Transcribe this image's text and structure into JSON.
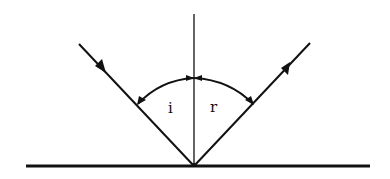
{
  "diagram": {
    "colors": {
      "ink": "#111111",
      "background": "#ffffff"
    },
    "surface": {
      "x1": 26,
      "y1": 166,
      "x2": 370,
      "y2": 166
    },
    "normal": {
      "x1": 194,
      "y1": 14,
      "x2": 194,
      "y2": 166
    },
    "incident_ray": {
      "x1": 79,
      "y1": 44,
      "x2": 194,
      "y2": 166,
      "arrow_at": [
        101,
        67
      ]
    },
    "reflected_ray": {
      "x1": 194,
      "y1": 166,
      "x2": 310,
      "y2": 43,
      "arrow_at": [
        286,
        69
      ]
    },
    "angle_arc": {
      "left": [
        137,
        104
      ],
      "top": [
        194,
        78
      ],
      "right": [
        253,
        104
      ]
    },
    "labels": {
      "incidence_angle": "i",
      "reflection_angle": "r"
    }
  }
}
